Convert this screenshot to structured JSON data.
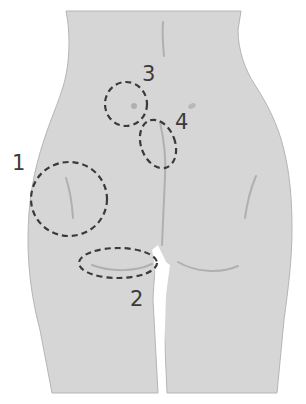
{
  "diagram": {
    "colors": {
      "background": "#ffffff",
      "skin": "#d6d6d6",
      "outline": "#b5b5b5",
      "markers": "#3a3a3a"
    },
    "regions": [
      {
        "id": 1,
        "label": "1",
        "shape": "circle",
        "location": "lateral hip / upper thigh (left side)"
      },
      {
        "id": 2,
        "label": "2",
        "shape": "ellipse",
        "location": "gluteal fold (left)"
      },
      {
        "id": 3,
        "label": "3",
        "shape": "circle",
        "location": "upper buttock / sacral dimple area"
      },
      {
        "id": 4,
        "label": "4",
        "shape": "ellipse",
        "location": "upper intergluteal cleft"
      }
    ]
  }
}
